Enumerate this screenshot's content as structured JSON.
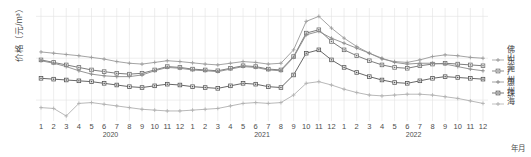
{
  "axes": {
    "ytitle": "价格（元/m³）",
    "xtitle": "年月",
    "yticks": [
      "700.000",
      "600.000",
      "500.000"
    ],
    "ytick_values": [
      700000,
      600000,
      500000
    ]
  },
  "legend": {
    "items": [
      {
        "label": "佛山",
        "color": "#9a9a9a",
        "marker": "plus"
      },
      {
        "label": "东莞",
        "color": "#6e6e6e",
        "marker": "square"
      },
      {
        "label": "广州",
        "color": "#8a8a8a",
        "marker": "plus"
      },
      {
        "label": "惠州",
        "color": "#565656",
        "marker": "square"
      },
      {
        "label": "珠海",
        "color": "#b0b0b0",
        "marker": "plus"
      }
    ]
  },
  "chart_data": {
    "type": "line",
    "title": "",
    "xlabel": "年月",
    "ylabel": "价格（元/m³）",
    "ylim": [
      450000,
      720000
    ],
    "grid": true,
    "legend_position": "right",
    "x": [
      "2020-1",
      "2020-2",
      "2020-3",
      "2020-4",
      "2020-5",
      "2020-6",
      "2020-7",
      "2020-8",
      "2020-9",
      "2020-10",
      "2020-11",
      "2020-12",
      "2021-1",
      "2021-2",
      "2021-3",
      "2021-4",
      "2021-5",
      "2021-6",
      "2021-7",
      "2021-8",
      "2021-9",
      "2021-10",
      "2021-11",
      "2021-12",
      "2022-1",
      "2022-2",
      "2022-3",
      "2022-4",
      "2022-5",
      "2022-6",
      "2022-7",
      "2022-8",
      "2022-9",
      "2022-10",
      "2022-11",
      "2022-12"
    ],
    "categories": [
      "1",
      "2",
      "3",
      "4",
      "5",
      "6",
      "7",
      "8",
      "9",
      "10",
      "11",
      "12",
      "1",
      "2",
      "3",
      "4",
      "5",
      "6",
      "7",
      "8",
      "9",
      "10",
      "11",
      "12",
      "1",
      "2",
      "3",
      "4",
      "5",
      "6",
      "7",
      "8",
      "9",
      "10",
      "11",
      "12"
    ],
    "year_labels": [
      {
        "label": "2020",
        "index": 5
      },
      {
        "label": "2021",
        "index": 17
      },
      {
        "label": "2022",
        "index": 29
      }
    ],
    "series": [
      {
        "name": "佛山",
        "color": "#9a9a9a",
        "marker": "plus",
        "values": [
          615000,
          612000,
          609000,
          606000,
          602000,
          598000,
          592000,
          588000,
          586000,
          590000,
          594000,
          592000,
          589000,
          586000,
          584000,
          588000,
          592000,
          590000,
          586000,
          588000,
          620000,
          688000,
          700000,
          672000,
          648000,
          628000,
          612000,
          598000,
          592000,
          590000,
          596000,
          604000,
          608000,
          606000,
          602000,
          600000
        ]
      },
      {
        "name": "东莞",
        "color": "#6e6e6e",
        "marker": "square",
        "values": [
          596000,
          590000,
          584000,
          578000,
          572000,
          568000,
          564000,
          562000,
          564000,
          572000,
          580000,
          578000,
          574000,
          572000,
          570000,
          576000,
          582000,
          580000,
          574000,
          572000,
          604000,
          660000,
          668000,
          640000,
          620000,
          606000,
          594000,
          584000,
          578000,
          576000,
          582000,
          586000,
          588000,
          586000,
          584000,
          582000
        ]
      },
      {
        "name": "广州",
        "color": "#8a8a8a",
        "marker": "plus",
        "values": [
          594000,
          588000,
          580000,
          570000,
          562000,
          558000,
          556000,
          556000,
          560000,
          570000,
          578000,
          576000,
          572000,
          570000,
          568000,
          574000,
          580000,
          578000,
          572000,
          570000,
          602000,
          656000,
          664000,
          648000,
          636000,
          624000,
          612000,
          600000,
          590000,
          586000,
          588000,
          588000,
          586000,
          580000,
          574000,
          570000
        ]
      },
      {
        "name": "惠州",
        "color": "#565656",
        "marker": "square",
        "values": [
          552000,
          550000,
          548000,
          546000,
          544000,
          540000,
          536000,
          532000,
          530000,
          534000,
          538000,
          536000,
          532000,
          530000,
          528000,
          534000,
          540000,
          538000,
          532000,
          530000,
          560000,
          612000,
          620000,
          596000,
          578000,
          566000,
          556000,
          548000,
          542000,
          540000,
          546000,
          552000,
          556000,
          554000,
          552000,
          550000
        ]
      },
      {
        "name": "珠海",
        "color": "#b0b0b0",
        "marker": "plus",
        "values": [
          482000,
          480000,
          462000,
          492000,
          494000,
          490000,
          486000,
          482000,
          478000,
          476000,
          474000,
          474000,
          476000,
          478000,
          480000,
          486000,
          492000,
          494000,
          492000,
          494000,
          512000,
          540000,
          544000,
          536000,
          526000,
          518000,
          512000,
          510000,
          512000,
          514000,
          514000,
          512000,
          508000,
          504000,
          498000,
          492000
        ]
      }
    ]
  }
}
